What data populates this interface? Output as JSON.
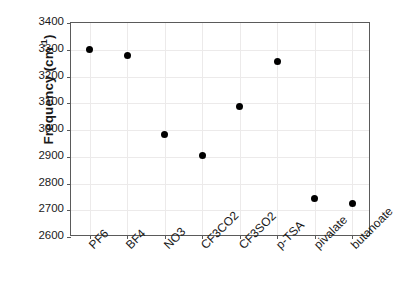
{
  "chart_data": {
    "type": "scatter",
    "title": "",
    "xlabel": "",
    "ylabel": "Frequency (cm",
    "ylabel_sup": "-1",
    "ylabel_suffix": ")",
    "categories": [
      "PF6",
      "BF4",
      "NO3",
      "CF3CO2",
      "CF3SO2",
      "p-TSA",
      "pivalate",
      "butanoate"
    ],
    "values": [
      3300,
      3277,
      2982,
      2903,
      3089,
      3257,
      2745,
      2726
    ],
    "series": [
      {
        "name": "Frequency",
        "values": [
          3300,
          3277,
          2982,
          2903,
          3089,
          3257,
          2745,
          2726
        ]
      }
    ],
    "ylim": [
      2600,
      3400
    ],
    "yticks": [
      3400,
      3300,
      3200,
      3100,
      3000,
      2900,
      2800,
      2700,
      2600
    ],
    "ytick_labels": [
      "3400",
      "3300",
      "3200",
      "3100",
      "3000",
      "2900",
      "2800",
      "2700",
      "2600"
    ],
    "grid": true,
    "legend": "none",
    "marker": "filled-circle",
    "marker_color": "#000000",
    "axis_color": "#5a5a5a",
    "grid_color": "#eceaea",
    "background": "#ffffff",
    "xtick_rotation": -45
  }
}
